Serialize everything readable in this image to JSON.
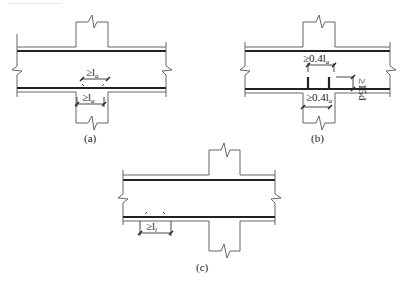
{
  "header_fragment": "——————",
  "figures": [
    {
      "id": "a",
      "caption": "(a)",
      "labels": {
        "top_lap": "≥l",
        "top_lap_sub": "a",
        "bottom_lap": "≥l",
        "bottom_lap_sub": "a"
      }
    },
    {
      "id": "b",
      "caption": "(b)",
      "labels": {
        "top_anchor": "≥0.4l",
        "top_anchor_sub": "a",
        "bottom_anchor": "≥0.4l",
        "bottom_anchor_sub": "a",
        "bend": "≥15d"
      }
    },
    {
      "id": "c",
      "caption": "(c)",
      "labels": {
        "lap": "≥l",
        "lap_sub": "l"
      }
    }
  ]
}
